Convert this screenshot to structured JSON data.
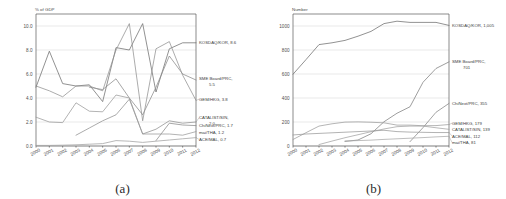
{
  "figure": {
    "panels": [
      {
        "caption": "(a)"
      },
      {
        "caption": "(b)"
      }
    ]
  },
  "chart_data": [
    {
      "type": "line",
      "panel": "(a)",
      "title": "",
      "xlabel": "",
      "ylabel": "% of GDP",
      "ylim": [
        0.0,
        11.0
      ],
      "yticks": [
        "0.0",
        "2.0",
        "4.0",
        "6.0",
        "8.0",
        "10.0"
      ],
      "ytick_values": [
        0.0,
        2.0,
        4.0,
        6.0,
        8.0,
        10.0
      ],
      "grid": true,
      "legend_position": "right-of-axes",
      "x": [
        2000,
        2001,
        2002,
        2003,
        2004,
        2005,
        2006,
        2007,
        2008,
        2009,
        2010,
        2011,
        2012
      ],
      "xtick_labels": [
        "2000",
        "2001",
        "2002",
        "2003",
        "2004",
        "2005",
        "2006",
        "2007",
        "2008",
        "2009",
        "2010",
        "2011",
        "2012"
      ],
      "series": [
        {
          "name": "KOSDAQ/KOR",
          "label": "KOSDAQ/KOR, 8.6",
          "end_value": 8.6,
          "color": "#6e6e6e",
          "label_y": 8.6,
          "values": [
            4.9,
            7.9,
            5.2,
            5.0,
            5.1,
            3.7,
            8.2,
            8.0,
            10.2,
            4.5,
            8.1,
            8.6,
            8.6
          ]
        },
        {
          "name": "SME Board/PRC",
          "label": "SME Board/PRC, 5.5",
          "end_value": 5.5,
          "color": "#8a8a8a",
          "label_y": 5.6,
          "values": [
            null,
            null,
            null,
            null,
            4.9,
            4.7,
            5.6,
            4.0,
            2.6,
            4.9,
            7.5,
            6.0,
            5.5
          ]
        },
        {
          "name": "GEM/HKG",
          "label": "GEM/HKG, 3.8",
          "end_value": 3.8,
          "color": "#909090",
          "label_y": 3.9,
          "values": [
            5.0,
            4.6,
            4.1,
            5.0,
            5.0,
            4.6,
            8.0,
            10.2,
            2.1,
            8.1,
            8.7,
            5.9,
            3.8
          ]
        },
        {
          "name": "CATALIST/SIN",
          "label": "CATALIST/SIN, 2.0",
          "end_value": 2.0,
          "color": "#8f8f8f",
          "label_y": 2.35,
          "values": [
            null,
            null,
            null,
            0.9,
            1.5,
            2.1,
            2.6,
            3.9,
            1.0,
            1.4,
            2.1,
            1.9,
            2.0
          ]
        },
        {
          "name": "ChiNext/PRC",
          "label": "ChiNext/PRC, 1.7",
          "end_value": 1.7,
          "color": "#8a8a8a",
          "label_y": 1.75,
          "values": [
            null,
            null,
            null,
            null,
            null,
            null,
            null,
            null,
            null,
            0.45,
            1.9,
            1.75,
            1.7
          ]
        },
        {
          "name": "mai/THA",
          "label": "mai/THA, 1.2",
          "end_value": 1.2,
          "color": "#9a9a9a",
          "label_y": 1.2,
          "values": [
            2.4,
            2.0,
            1.95,
            3.6,
            2.9,
            2.85,
            4.25,
            4.0,
            1.0,
            1.0,
            1.0,
            0.9,
            1.2
          ]
        },
        {
          "name": "ACE/MAL",
          "label": "ACE/MAL, 0.7",
          "end_value": 0.7,
          "color": "#a0a0a0",
          "label_y": 0.62,
          "values": [
            0.05,
            0.05,
            0.07,
            0.1,
            0.15,
            0.2,
            0.45,
            0.4,
            0.3,
            0.4,
            0.5,
            0.6,
            0.7
          ]
        }
      ]
    },
    {
      "type": "line",
      "panel": "(b)",
      "title": "",
      "xlabel": "",
      "ylabel": "Number",
      "ylim": [
        0,
        1100
      ],
      "yticks": [
        "0",
        "200",
        "400",
        "600",
        "800",
        "1000"
      ],
      "ytick_values": [
        0,
        200,
        400,
        600,
        800,
        1000
      ],
      "grid": true,
      "legend_position": "right-of-axes",
      "x": [
        2000,
        2001,
        2002,
        2003,
        2004,
        2005,
        2006,
        2007,
        2008,
        2009,
        2010,
        2011,
        2012
      ],
      "xtick_labels": [
        "2000",
        "2001",
        "2002",
        "2003",
        "2004",
        "2005",
        "2006",
        "2007",
        "2008",
        "2009",
        "2010",
        "2011",
        "2012"
      ],
      "series": [
        {
          "name": "KOSDAQ/KOR",
          "label": "KOSDAQ/KOR, 1,005",
          "end_value": 1005,
          "color": "#6e6e6e",
          "label_y": 1005,
          "values": [
            598,
            720,
            845,
            860,
            880,
            915,
            955,
            1020,
            1040,
            1030,
            1030,
            1030,
            1005
          ]
        },
        {
          "name": "SME Board/PRC",
          "label": "SME Board/PRC, 701",
          "end_value": 701,
          "color": "#7d7d7d",
          "label_y": 701,
          "values": [
            null,
            null,
            null,
            null,
            38,
            50,
            102,
            202,
            273,
            327,
            531,
            646,
            701
          ]
        },
        {
          "name": "ChiNext/PRC",
          "label": "ChiNext/PRC, 355",
          "end_value": 355,
          "color": "#858585",
          "label_y": 355,
          "values": [
            null,
            null,
            null,
            null,
            null,
            null,
            null,
            null,
            null,
            36,
            153,
            281,
            355
          ]
        },
        {
          "name": "GEM/HKG",
          "label": "GEM/HKG, 179",
          "end_value": 179,
          "color": "#9c9c9c",
          "label_y": 190,
          "values": [
            54,
            111,
            166,
            185,
            199,
            201,
            198,
            193,
            174,
            174,
            169,
            170,
            179
          ]
        },
        {
          "name": "CATALIST/SIN",
          "label": "CATALIST/SIN, 139",
          "end_value": 139,
          "color": "#a2a2a2",
          "label_y": 152,
          "values": [
            null,
            null,
            12,
            41,
            69,
            94,
            119,
            142,
            161,
            166,
            166,
            152,
            139
          ]
        },
        {
          "name": "ACE/MAL",
          "label": "ACE/MAL, 112",
          "end_value": 112,
          "color": "#9a9a9a",
          "label_y": 112,
          "values": [
            92,
            100,
            105,
            110,
            115,
            120,
            125,
            131,
            120,
            116,
            114,
            112,
            112
          ]
        },
        {
          "name": "mai/THA",
          "label": "mai/THA, 81",
          "end_value": 81,
          "color": "#a8a8a8",
          "label_y": 78,
          "values": [
            null,
            null,
            null,
            null,
            42,
            45,
            49,
            55,
            60,
            65,
            70,
            76,
            81
          ]
        }
      ]
    }
  ]
}
